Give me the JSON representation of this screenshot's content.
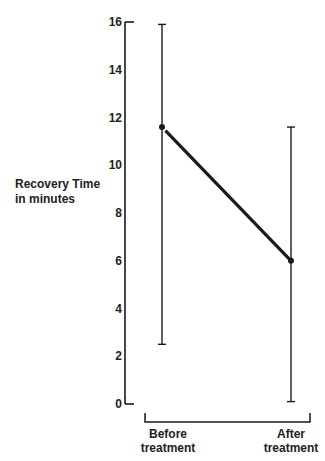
{
  "chart_data": {
    "type": "line",
    "title": "",
    "xlabel": "",
    "ylabel": "Recovery Time in minutes",
    "ylabel_lines": [
      "Recovery Time",
      "in minutes"
    ],
    "ylim": [
      0,
      16
    ],
    "yticks": [
      0,
      2,
      4,
      6,
      8,
      10,
      12,
      14,
      16
    ],
    "categories": [
      "Before treatment",
      "After treatment"
    ],
    "category_lines": [
      [
        "Before",
        "treatment"
      ],
      [
        "After",
        "treatment"
      ]
    ],
    "series": [
      {
        "name": "Recovery Time",
        "values": [
          11.6,
          6.0
        ],
        "error_low": [
          2.5,
          0.1
        ],
        "error_high": [
          15.9,
          11.6
        ]
      }
    ],
    "grid": false,
    "legend": null
  },
  "colors": {
    "ink": "#1a1a1a",
    "background": "#ffffff"
  }
}
